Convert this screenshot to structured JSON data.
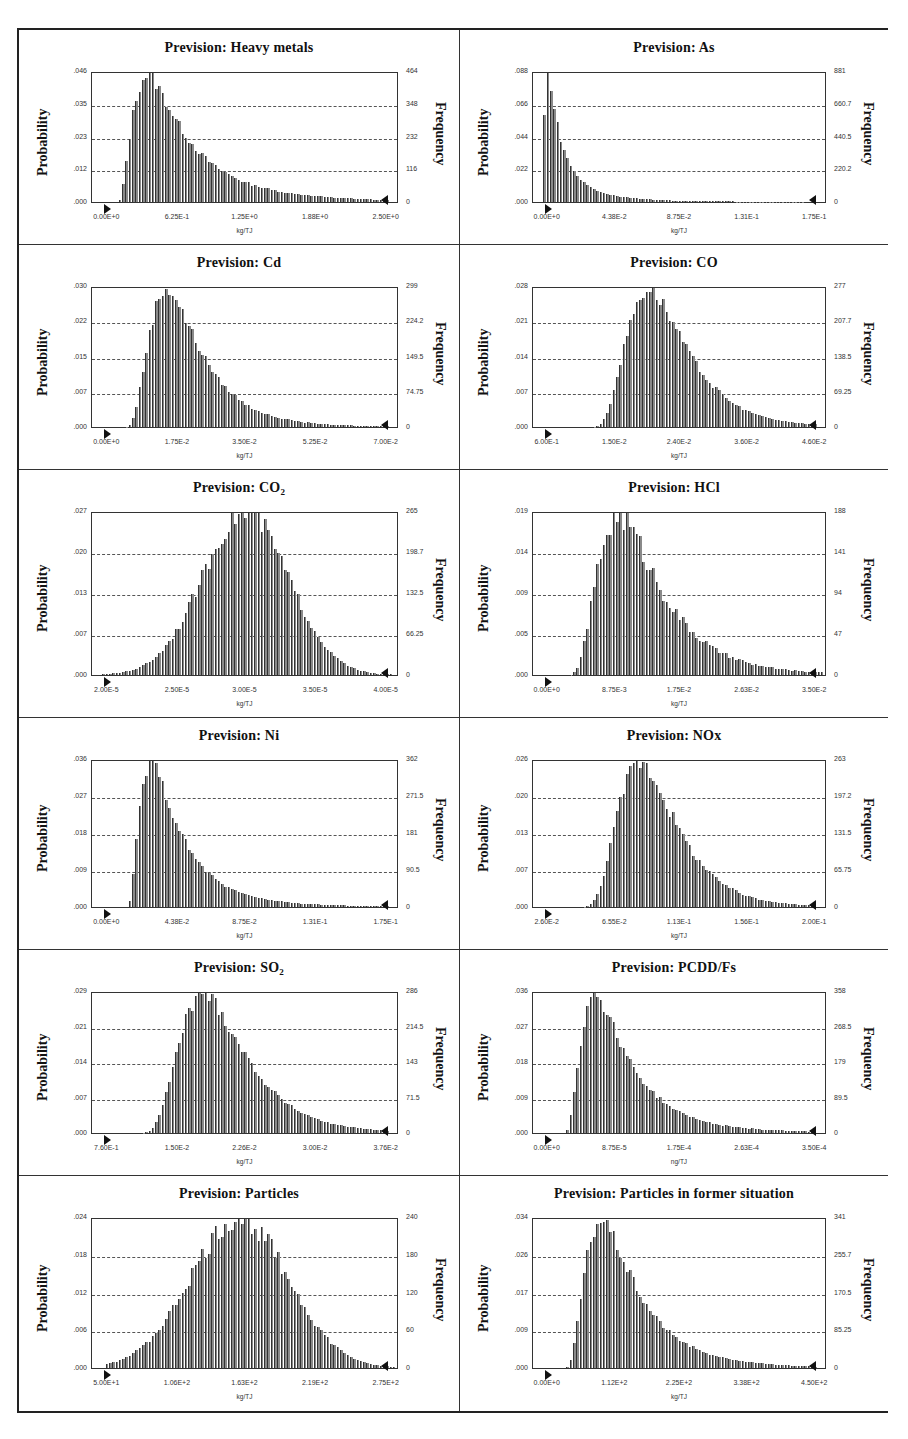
{
  "chart_data": [
    {
      "id": "heavy-metals",
      "type": "bar",
      "title": "Prevision: Heavy metals",
      "subscript": "",
      "ylabel": "Probability",
      "y2label": "Frequency",
      "xlabel": "kg/TJ",
      "yticks": [
        ".000",
        ".012",
        ".023",
        ".035",
        ".046"
      ],
      "y2ticks": [
        "0",
        "116",
        "232",
        "348",
        "464"
      ],
      "xticks": [
        "0.00E+0",
        "6.25E-1",
        "1.25E+0",
        "1.88E+0",
        "2.50E+0"
      ],
      "ylim": [
        0,
        0.046
      ],
      "y2lim": [
        0,
        464
      ],
      "xlim": [
        0,
        2.5
      ],
      "shape": {
        "kind": "lognormal",
        "start": 0.08,
        "peak": 0.19,
        "tail": 0.8,
        "end": 0.97,
        "jitter": 0.06
      },
      "peak_probability": 0.046,
      "peak_x": 0.5
    },
    {
      "id": "as",
      "type": "bar",
      "title": "Prevision: As",
      "subscript": "",
      "ylabel": "Probability",
      "y2label": "Frequency",
      "xlabel": "kg/TJ",
      "yticks": [
        ".000",
        ".022",
        ".044",
        ".066",
        ".088"
      ],
      "y2ticks": [
        "0",
        "220.2",
        "440.5",
        "660.7",
        "881"
      ],
      "xticks": [
        "0.00E+0",
        "4.38E-2",
        "8.75E-2",
        "1.31E-1",
        "1.75E-1"
      ],
      "ylim": [
        0,
        0.088
      ],
      "y2lim": [
        0,
        881
      ],
      "xlim": [
        0,
        0.175
      ],
      "shape": {
        "kind": "lognormal",
        "start": 0.03,
        "peak": 0.055,
        "tail": 1.1,
        "end": 0.92,
        "jitter": 0.05
      },
      "peak_probability": 0.088,
      "peak_x": 0.0087
    },
    {
      "id": "cd",
      "type": "bar",
      "title": "Prevision: Cd",
      "subscript": "",
      "ylabel": "Probability",
      "y2label": "Frequency",
      "xlabel": "kg/TJ",
      "yticks": [
        ".000",
        ".007",
        ".015",
        ".022",
        ".030"
      ],
      "y2ticks": [
        "0",
        "74.75",
        "149.5",
        "224.2",
        "299"
      ],
      "xticks": [
        "0.00E+0",
        "1.75E-2",
        "3.50E-2",
        "5.25E-2",
        "7.00E-2"
      ],
      "ylim": [
        0,
        0.03
      ],
      "y2lim": [
        0,
        299
      ],
      "xlim": [
        0,
        0.07
      ],
      "shape": {
        "kind": "lognormal",
        "start": 0.09,
        "peak": 0.25,
        "tail": 0.55,
        "end": 0.97,
        "jitter": 0.06
      },
      "peak_probability": 0.03,
      "peak_x": 0.0175
    },
    {
      "id": "co",
      "type": "bar",
      "title": "Prevision: CO",
      "subscript": "",
      "ylabel": "Probability",
      "y2label": "Frequency",
      "xlabel": "kg/TJ",
      "yticks": [
        ".000",
        ".007",
        ".014",
        ".021",
        ".028"
      ],
      "y2ticks": [
        "0",
        "69.25",
        "138.5",
        "207.7",
        "277"
      ],
      "xticks": [
        "6.00E-1",
        "1.50E-2",
        "2.40E-2",
        "3.60E-2",
        "4.60E-2"
      ],
      "ylim": [
        0,
        0.028
      ],
      "y2lim": [
        0,
        277
      ],
      "xlim": [
        0.006,
        0.046
      ],
      "shape": {
        "kind": "lognormal",
        "start": 0.16,
        "peak": 0.4,
        "tail": 0.45,
        "end": 0.97,
        "jitter": 0.06
      },
      "peak_probability": 0.028,
      "peak_x": 0.021
    },
    {
      "id": "co2",
      "type": "bar",
      "title": "Prevision: CO",
      "subscript": "2",
      "ylabel": "Probability",
      "y2label": "Frequency",
      "xlabel": "kg/TJ",
      "yticks": [
        ".000",
        ".007",
        ".013",
        ".020",
        ".027"
      ],
      "y2ticks": [
        "0",
        "66.25",
        "132.5",
        "198.7",
        "265"
      ],
      "xticks": [
        "2.00E-5",
        "2.50E-5",
        "3.00E-5",
        "3.50E-5",
        "4.00E-5"
      ],
      "ylim": [
        0,
        0.027
      ],
      "y2lim": [
        0,
        265
      ],
      "xlim": [
        2e-05,
        4e-05
      ],
      "shape": {
        "kind": "normal",
        "start": 0.03,
        "peak": 0.5,
        "sigma": 0.14,
        "end": 0.98,
        "jitter": 0.07
      },
      "peak_probability": 0.027,
      "peak_x": 3e-05
    },
    {
      "id": "hcl",
      "type": "bar",
      "title": "Prevision: HCl",
      "subscript": "",
      "ylabel": "Probability",
      "y2label": "Frequency",
      "xlabel": "kg/TJ",
      "yticks": [
        ".000",
        ".005",
        ".009",
        ".014",
        ".019"
      ],
      "y2ticks": [
        "0",
        "47",
        "94",
        "141",
        "188"
      ],
      "xticks": [
        "0.00E+0",
        "8.75E-3",
        "1.75E-2",
        "2.63E-2",
        "3.50E-2"
      ],
      "ylim": [
        0,
        0.019
      ],
      "y2lim": [
        0,
        188
      ],
      "xlim": [
        0,
        0.035
      ],
      "shape": {
        "kind": "lognormal",
        "start": 0.1,
        "peak": 0.3,
        "tail": 0.55,
        "end": 0.99,
        "jitter": 0.1
      },
      "peak_probability": 0.019,
      "peak_x": 0.0105
    },
    {
      "id": "ni",
      "type": "bar",
      "title": "Prevision: Ni",
      "subscript": "",
      "ylabel": "Probability",
      "y2label": "Frequency",
      "xlabel": "kg/TJ",
      "yticks": [
        ".000",
        ".009",
        ".018",
        ".027",
        ".036"
      ],
      "y2ticks": [
        "0",
        "90.5",
        "181",
        "271.5",
        "362"
      ],
      "xticks": [
        "0.00E+0",
        "4.38E-2",
        "8.75E-2",
        "1.31E-1",
        "1.75E-1"
      ],
      "ylim": [
        0,
        0.036
      ],
      "y2lim": [
        0,
        362
      ],
      "xlim": [
        0,
        0.175
      ],
      "shape": {
        "kind": "lognormal",
        "start": 0.11,
        "peak": 0.2,
        "tail": 0.75,
        "end": 0.97,
        "jitter": 0.05
      },
      "peak_probability": 0.036,
      "peak_x": 0.04
    },
    {
      "id": "nox",
      "type": "bar",
      "title": "Prevision: NOx",
      "subscript": "",
      "ylabel": "Probability",
      "y2label": "Frequency",
      "xlabel": "kg/TJ",
      "yticks": [
        ".000",
        ".007",
        ".013",
        ".020",
        ".026"
      ],
      "y2ticks": [
        "0",
        "65.75",
        "131.5",
        "197.2",
        "263"
      ],
      "xticks": [
        "2.60E-2",
        "6.55E-2",
        "1.13E-1",
        "1.56E-1",
        "2.00E-1"
      ],
      "ylim": [
        0,
        0.026
      ],
      "y2lim": [
        0,
        263
      ],
      "xlim": [
        0.026,
        0.2
      ],
      "shape": {
        "kind": "lognormal",
        "start": 0.12,
        "peak": 0.37,
        "tail": 0.42,
        "end": 0.96,
        "jitter": 0.07
      },
      "peak_probability": 0.026,
      "peak_x": 0.09
    },
    {
      "id": "so2",
      "type": "bar",
      "title": "Prevision: SO",
      "subscript": "2",
      "ylabel": "Probability",
      "y2label": "Frequency",
      "xlabel": "kg/TJ",
      "yticks": [
        ".000",
        ".007",
        ".014",
        ".021",
        ".029"
      ],
      "y2ticks": [
        "0",
        "71.5",
        "143",
        "214.5",
        "286"
      ],
      "xticks": [
        "7.60E-1",
        "1.50E-2",
        "2.26E-2",
        "3.00E-2",
        "3.76E-2"
      ],
      "ylim": [
        0,
        0.029
      ],
      "y2lim": [
        0,
        286
      ],
      "xlim": [
        0.0076,
        0.0376
      ],
      "shape": {
        "kind": "lognormal",
        "start": 0.12,
        "peak": 0.37,
        "tail": 0.45,
        "end": 0.97,
        "jitter": 0.06
      },
      "peak_probability": 0.029,
      "peak_x": 0.019
    },
    {
      "id": "pcdd-fs",
      "type": "bar",
      "title": "Prevision: PCDD/Fs",
      "subscript": "",
      "ylabel": "Probability",
      "y2label": "Frequency",
      "xlabel": "ng/TJ",
      "yticks": [
        ".000",
        ".009",
        ".018",
        ".027",
        ".036"
      ],
      "y2ticks": [
        "0",
        "89.5",
        "179",
        "268.5",
        "358"
      ],
      "xticks": [
        "0.00E+0",
        "8.75E-5",
        "1.75E-4",
        "2.63E-4",
        "3.50E-4"
      ],
      "ylim": [
        0,
        0.036
      ],
      "y2lim": [
        0,
        358
      ],
      "xlim": [
        0,
        0.00035
      ],
      "shape": {
        "kind": "lognormal",
        "start": 0.1,
        "peak": 0.22,
        "tail": 0.7,
        "end": 0.96,
        "jitter": 0.06
      },
      "peak_probability": 0.036,
      "peak_x": 7.5e-05
    },
    {
      "id": "particles",
      "type": "bar",
      "title": "Prevision: Particles",
      "subscript": "",
      "ylabel": "Probability",
      "y2label": "Frequency",
      "xlabel": "kg/TJ",
      "yticks": [
        ".000",
        ".006",
        ".012",
        ".018",
        ".024"
      ],
      "y2ticks": [
        "0",
        "60",
        "120",
        "180",
        "240"
      ],
      "xticks": [
        "5.00E+1",
        "1.06E+2",
        "1.63E+2",
        "2.19E+2",
        "2.75E+2"
      ],
      "ylim": [
        0,
        0.024
      ],
      "y2lim": [
        0,
        240
      ],
      "xlim": [
        50,
        275
      ],
      "shape": {
        "kind": "normal",
        "start": 0.04,
        "peak": 0.48,
        "sigma": 0.16,
        "end": 0.99,
        "jitter": 0.08
      },
      "peak_probability": 0.024,
      "peak_x": 158
    },
    {
      "id": "particles-former",
      "type": "bar",
      "title": "Prevision: Particles in former situation",
      "subscript": "",
      "ylabel": "Probability",
      "y2label": "Frequency",
      "xlabel": "kg/TJ",
      "yticks": [
        ".000",
        ".009",
        ".017",
        ".026",
        ".034"
      ],
      "y2ticks": [
        "0",
        "85.25",
        "170.5",
        "255.7",
        "341"
      ],
      "xticks": [
        "0.00E+0",
        "1.12E+2",
        "2.25E+2",
        "3.38E+2",
        "4.50E+2"
      ],
      "ylim": [
        0,
        0.034
      ],
      "y2lim": [
        0,
        341
      ],
      "xlim": [
        0,
        450
      ],
      "shape": {
        "kind": "lognormal",
        "start": 0.1,
        "peak": 0.24,
        "tail": 0.65,
        "end": 0.97,
        "jitter": 0.06
      },
      "peak_probability": 0.034,
      "peak_x": 90
    }
  ],
  "style": {
    "bar_color": "#8a8a8a",
    "bar_edge": "#333333",
    "grid_color": "#555555",
    "frame_color": "#222222"
  }
}
